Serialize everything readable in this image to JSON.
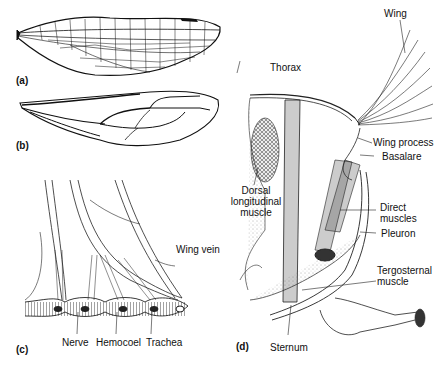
{
  "figure": {
    "panels": [
      {
        "id": "a",
        "label": "(a)",
        "description": "Densely reticulated insect wing"
      },
      {
        "id": "b",
        "label": "(b)",
        "description": "Insect wing with few veins"
      },
      {
        "id": "c",
        "label": "(c)",
        "description": "Cross-section of wing vein",
        "annotations": [
          "Wing vein",
          "Nerve",
          "Hemocoel",
          "Trachea"
        ]
      },
      {
        "id": "d",
        "label": "(d)",
        "description": "Thorax with flight muscles",
        "annotations": [
          "Wing",
          "Thorax",
          "Wing process",
          "Basalare",
          "Dorsal longitudinal muscle",
          "Direct muscles",
          "Pleuron",
          "Tergosternal muscle",
          "Sternum"
        ]
      }
    ]
  },
  "labels": {
    "a": "(a)",
    "b": "(b)",
    "c": "(c)",
    "d": "(d)",
    "wing_vein": "Wing vein",
    "nerve": "Nerve",
    "hemocoel": "Hemocoel",
    "trachea": "Trachea",
    "wing": "Wing",
    "thorax": "Thorax",
    "wing_process": "Wing process",
    "basalare": "Basalare",
    "dorsal_1": "Dorsal",
    "dorsal_2": "longitudinal",
    "dorsal_3": "muscle",
    "direct_1": "Direct",
    "direct_2": "muscles",
    "pleuron": "Pleuron",
    "terg_1": "Tergosternal",
    "terg_2": "muscle",
    "sternum": "Sternum"
  }
}
